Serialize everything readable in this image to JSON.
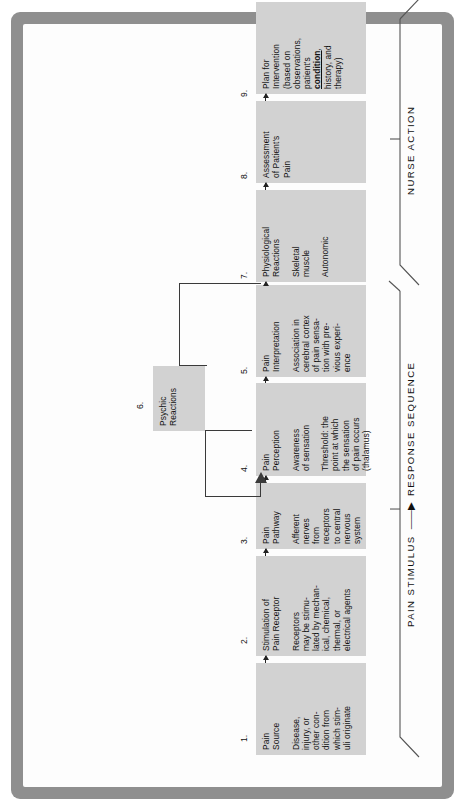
{
  "diagram": {
    "box_fill": "#d2d2d2",
    "frame_color": "#8f8f8f",
    "boxes": [
      {
        "number": "1.",
        "heading": "Pain\nSource",
        "body": [
          "Disease,\ninjury, or\nother con-\ndition from\nwhich stim-\nuli originate"
        ]
      },
      {
        "number": "2.",
        "heading": "Stimulation of\nPain Receptor",
        "body": [
          "Receptors\nmay be stimu-\nlated by mechan-\nical, chemical,\nthermal, or\nelectrical agents"
        ]
      },
      {
        "number": "3.",
        "heading": "Pain\nPathway",
        "body": [
          "Afferent\nnerves\nfrom\nreceptors\nto central\nnervous\nsystem"
        ]
      },
      {
        "number": "4.",
        "heading": "Pain\nPerception",
        "body": [
          "Awareness\nof sensation",
          "Threshold: the\npoint at which\nthe sensation\nof pain occurs\n(thalamus)"
        ]
      },
      {
        "number": "5.",
        "heading": "Pain\nInterpretation",
        "body": [
          "Association in\ncerebral cortex\nof pain sensa-\ntion with pre-\nvious experi-\nence"
        ]
      },
      {
        "number": "6.",
        "heading": "Psychic\nReactions",
        "body": []
      },
      {
        "number": "7.",
        "heading": "Physiological\nReactions",
        "body": [
          "Skeletal\nmuscle",
          "Autonomic"
        ]
      },
      {
        "number": "8.",
        "heading": "Assessment\nof Patient's\nPain",
        "body": []
      },
      {
        "number": "9.",
        "heading": "Plan for\nIntervention\n(based on\nobservations,\npatient's\n",
        "heading_emphasis": "condition",
        "heading_tail": ",\nhistory, and\ntherapy)",
        "body": []
      }
    ],
    "sections": [
      {
        "id": "response-sequence",
        "label_a": "PAIN STIMULUS",
        "arrow": "——▶",
        "label_b": "RESPONSE SEQUENCE"
      },
      {
        "id": "nurse-action",
        "label": "NURSE ACTION"
      }
    ]
  }
}
